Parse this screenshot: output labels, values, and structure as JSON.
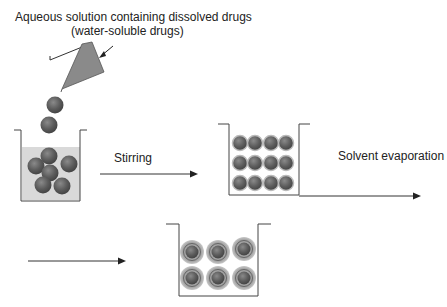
{
  "labels": {
    "title_line1": "Aqueous solution containing dissolved drugs",
    "title_line2": "(water-soluble drugs)",
    "step1": "Stirring",
    "step2": "Solvent evaporation"
  },
  "stages": [
    {
      "name": "mixing-beaker",
      "particles": 7,
      "falling_particles": 2,
      "has_liquid": true
    },
    {
      "name": "stirred-beaker",
      "rows": 3,
      "cols": 4,
      "particle_type": "coated-sphere"
    },
    {
      "name": "final-beaker",
      "rows": 2,
      "cols": 3,
      "particle_type": "core-shell-sphere"
    }
  ],
  "colors": {
    "particle": "#5f5f5f",
    "liquid": "#d9d9d9",
    "funnel": "#8a8a8a",
    "line": "#333333",
    "text": "#222222"
  }
}
